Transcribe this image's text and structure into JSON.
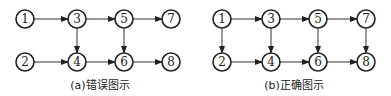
{
  "diagrams": [
    {
      "caption": "(a)错误图示",
      "nodes": [
        {
          "id": "1",
          "x": 25,
          "y": 19
        },
        {
          "id": "3",
          "x": 77,
          "y": 19
        },
        {
          "id": "5",
          "x": 124,
          "y": 19
        },
        {
          "id": "7",
          "x": 171,
          "y": 19
        },
        {
          "id": "2",
          "x": 25,
          "y": 62
        },
        {
          "id": "4",
          "x": 77,
          "y": 62
        },
        {
          "id": "6",
          "x": 124,
          "y": 62
        },
        {
          "id": "8",
          "x": 171,
          "y": 62
        }
      ],
      "edges": [
        [
          "1",
          "3"
        ],
        [
          "3",
          "5"
        ],
        [
          "5",
          "7"
        ],
        [
          "2",
          "4"
        ],
        [
          "4",
          "6"
        ],
        [
          "6",
          "8"
        ],
        [
          "3",
          "4"
        ],
        [
          "5",
          "6"
        ]
      ]
    },
    {
      "caption": "(b)正确图示",
      "nodes": [
        {
          "id": "1",
          "x": 222,
          "y": 19
        },
        {
          "id": "3",
          "x": 271,
          "y": 19
        },
        {
          "id": "5",
          "x": 318,
          "y": 19
        },
        {
          "id": "7",
          "x": 366,
          "y": 19
        },
        {
          "id": "2",
          "x": 222,
          "y": 62
        },
        {
          "id": "4",
          "x": 271,
          "y": 62
        },
        {
          "id": "6",
          "x": 318,
          "y": 62
        },
        {
          "id": "8",
          "x": 366,
          "y": 62
        }
      ],
      "edges": [
        [
          "1",
          "3"
        ],
        [
          "3",
          "5"
        ],
        [
          "5",
          "7"
        ],
        [
          "2",
          "4"
        ],
        [
          "4",
          "6"
        ],
        [
          "6",
          "8"
        ],
        [
          "1",
          "2"
        ],
        [
          "3",
          "4"
        ],
        [
          "5",
          "6"
        ],
        [
          "7",
          "8"
        ]
      ]
    }
  ]
}
